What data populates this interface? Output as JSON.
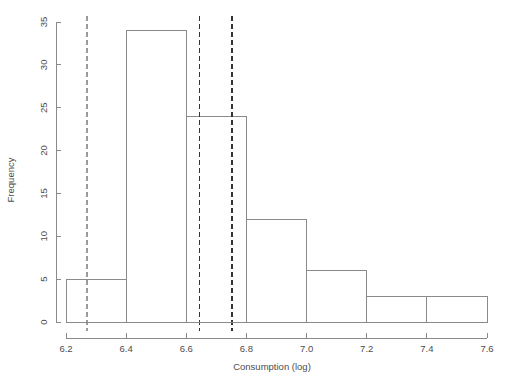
{
  "chart_data": {
    "type": "bar",
    "title": "",
    "subtitle": "",
    "xlabel": "Consumption (log)",
    "ylabel": "Frequency",
    "xlim": [
      6.2,
      7.6
    ],
    "ylim": [
      0,
      35
    ],
    "grid": false,
    "legend": null,
    "bin_width": 0.2,
    "bin_edges": [
      6.2,
      6.4,
      6.6,
      6.8,
      7.0,
      7.2,
      7.4,
      7.6
    ],
    "categories": [
      "6.2-6.4",
      "6.4-6.6",
      "6.6-6.8",
      "6.8-7.0",
      "7.0-7.2",
      "7.2-7.4",
      "7.4-7.6"
    ],
    "values": [
      5,
      34,
      24,
      12,
      6,
      3,
      3
    ],
    "bars": [
      {
        "x0": 6.2,
        "x1": 6.4,
        "count": 5
      },
      {
        "x0": 6.4,
        "x1": 6.6,
        "count": 34
      },
      {
        "x0": 6.6,
        "x1": 6.8,
        "count": 24
      },
      {
        "x0": 6.8,
        "x1": 7.0,
        "count": 12
      },
      {
        "x0": 7.0,
        "x1": 7.2,
        "count": 6
      },
      {
        "x0": 7.2,
        "x1": 7.4,
        "count": 3
      },
      {
        "x0": 7.4,
        "x1": 7.6,
        "count": 3
      }
    ],
    "xticks": [
      6.2,
      6.4,
      6.6,
      6.8,
      7.0,
      7.2,
      7.4,
      7.6
    ],
    "xtick_labels": [
      "6.2",
      "6.4",
      "6.6",
      "6.8",
      "7.0",
      "7.2",
      "7.4",
      "7.6"
    ],
    "yticks": [
      0,
      5,
      10,
      15,
      20,
      25,
      30,
      35
    ],
    "ytick_labels": [
      "0",
      "5",
      "10",
      "15",
      "20",
      "25",
      "30",
      "35"
    ],
    "annotations": [
      {
        "name": "reference-line-1",
        "type": "vline",
        "x": 6.27,
        "style": "dashed",
        "color": "#9a9a9a"
      },
      {
        "name": "reference-line-2",
        "type": "vline",
        "x": 6.645,
        "style": "dashed",
        "color": "#333333"
      },
      {
        "name": "reference-line-3",
        "type": "vline",
        "x": 6.752,
        "style": "dashed",
        "color": "#333333"
      }
    ],
    "colors": {
      "bar_stroke": "#8a8a8a",
      "bar_fill": "none",
      "axis": "#8a8a8a",
      "text": "#4d4d4d",
      "vline_dark": "#333333",
      "vline_light": "#9a9a9a",
      "background": "#ffffff"
    }
  }
}
